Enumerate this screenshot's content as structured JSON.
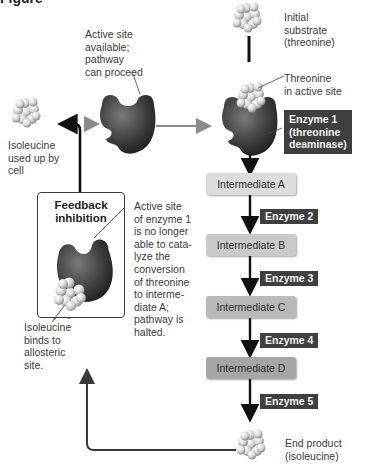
{
  "figure": {
    "clipped_title_left": "Figure",
    "clipped_title_right": ""
  },
  "labels": {
    "initial_substrate": "Initial\nsubstrate\n(threonine)",
    "active_site_available": "Active site\navailable;\npathway\ncan proceed",
    "threonine_in_active_site": "Threonine\nin active site",
    "isoleucine_used": "Isoleucine\nused up by\ncell",
    "feedback_inhibition": "Feedback\ninhibition",
    "active_site_blocked": "Active site\nof enzyme 1\nis no longer\nable to cata-\nlyze the\nconversion\nof threonine\nto interme-\ndiate A;\npathway is\nhalted.",
    "isoleucine_binds": "Isoleucine\nbinds to\nallosteric\nsite.",
    "end_product": "End product\n(isoleucine)"
  },
  "pathway": {
    "enzyme1": "Enzyme 1\n(threonine\ndeaminase)",
    "steps": [
      {
        "intermediate": "Intermediate A",
        "enzyme_after": "Enzyme 2",
        "color": "#dcdcdc"
      },
      {
        "intermediate": "Intermediate B",
        "enzyme_after": "Enzyme 3",
        "color": "#cacaca"
      },
      {
        "intermediate": "Intermediate C",
        "enzyme_after": "Enzyme 4",
        "color": "#b9b9b9"
      },
      {
        "intermediate": "Intermediate D",
        "enzyme_after": "Enzyme 5",
        "color": "#a6a6a6"
      }
    ]
  },
  "colors": {
    "enzyme_body": "#3a3a3a",
    "enzyme_label_bg": "#3f3f3f",
    "arrow_black": "#111111",
    "arrow_gray": "#8a8a8a",
    "feedback_line": "#3a3a3a",
    "molecule": "#d8d8d8"
  }
}
